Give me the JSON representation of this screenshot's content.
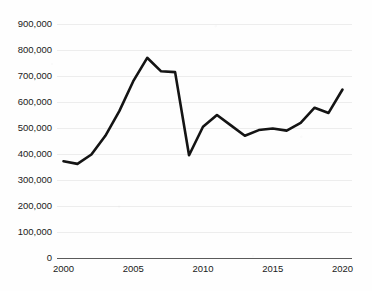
{
  "chart_data": {
    "type": "line",
    "title": "",
    "subtitle": "",
    "xlabel": "",
    "ylabel": "",
    "grid": true,
    "legend": false,
    "legend_position": "none",
    "line_color": "#141414",
    "gridline_color": "#ededed",
    "axis_color": "#5a5a5a",
    "background_color": "#fefefe",
    "xlim": [
      2000,
      2020
    ],
    "ylim": [
      0,
      900000
    ],
    "x_ticks": [
      2000,
      2005,
      2010,
      2015,
      2020
    ],
    "x_tick_labels": [
      "2000",
      "2005",
      "2010",
      "2015",
      "2020"
    ],
    "y_ticks": [
      0,
      100000,
      200000,
      300000,
      400000,
      500000,
      600000,
      700000,
      800000,
      900000
    ],
    "y_tick_labels": [
      "0",
      "100,000",
      "200,000",
      "300,000",
      "400,000",
      "500,000",
      "600,000",
      "700,000",
      "800,000",
      "900,000"
    ],
    "x": [
      2000,
      2001,
      2002,
      2003,
      2004,
      2005,
      2006,
      2007,
      2008,
      2009,
      2010,
      2011,
      2012,
      2013,
      2014,
      2015,
      2016,
      2017,
      2018,
      2019,
      2020
    ],
    "values": [
      372000,
      362000,
      398000,
      470000,
      565000,
      680000,
      770000,
      718000,
      715000,
      395000,
      505000,
      550000,
      510000,
      470000,
      492000,
      498000,
      490000,
      520000,
      578000,
      558000,
      648000
    ],
    "series": [
      {
        "name": "series-1",
        "values": [
          372000,
          362000,
          398000,
          470000,
          565000,
          680000,
          770000,
          718000,
          715000,
          395000,
          505000,
          550000,
          510000,
          470000,
          492000,
          498000,
          490000,
          520000,
          578000,
          558000,
          648000
        ]
      }
    ]
  },
  "plot": {
    "area_name": "line-chart-plot-area"
  }
}
